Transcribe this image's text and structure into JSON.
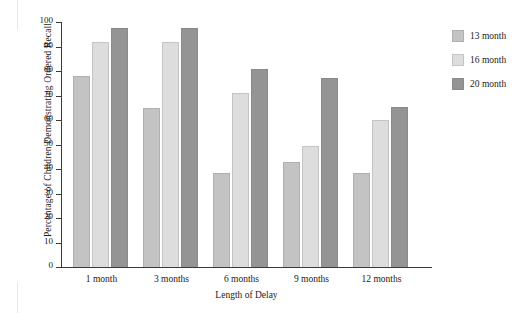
{
  "chart_data": {
    "type": "bar",
    "title": "",
    "xlabel": "Length of Delay",
    "ylabel": "Percentage of Children Demonstrating Ordered Recall",
    "categories": [
      "1 month",
      "3 months",
      "6 months",
      "9 months",
      "12 months"
    ],
    "series": [
      {
        "name": "13 month",
        "color": "#c3c3c3",
        "values": [
          78,
          65,
          38.5,
          43,
          38.5
        ]
      },
      {
        "name": "16 month",
        "color": "#dddddd",
        "values": [
          92,
          92,
          71,
          49.5,
          60
        ]
      },
      {
        "name": "20 month",
        "color": "#949494",
        "values": [
          97.5,
          97.5,
          81,
          77,
          65.5
        ]
      }
    ],
    "ylim": [
      0,
      100
    ],
    "yticks": [
      0,
      10,
      20,
      30,
      40,
      50,
      60,
      70,
      80,
      90,
      100
    ],
    "ytick_labels": [
      "0",
      "10",
      "20",
      "30",
      "40",
      "50",
      "60",
      "70",
      "80",
      "90",
      "100"
    ],
    "grid": false,
    "legend_position": "right"
  }
}
